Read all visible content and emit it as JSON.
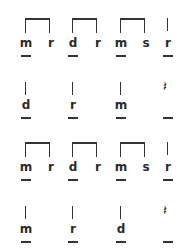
{
  "rows": [
    {
      "type": "beamed",
      "groups": [
        {
          "notes": [
            "m",
            "r"
          ],
          "underline": [
            true,
            false
          ]
        },
        {
          "notes": [
            "d",
            "r"
          ],
          "underline": [
            true,
            false
          ]
        },
        {
          "notes": [
            "m",
            "s"
          ],
          "underline": [
            true,
            false
          ]
        }
      ],
      "last": {
        "note": "r",
        "underline": true
      }
    },
    {
      "type": "quarters",
      "notes": [
        "d",
        "r",
        "m"
      ],
      "rest_icon": "quarter-rest"
    },
    {
      "type": "beamed",
      "groups": [
        {
          "notes": [
            "m",
            "r"
          ],
          "underline": [
            true,
            false
          ]
        },
        {
          "notes": [
            "d",
            "r"
          ],
          "underline": [
            true,
            false
          ]
        },
        {
          "notes": [
            "m",
            "s"
          ],
          "underline": [
            true,
            false
          ]
        }
      ],
      "last": {
        "note": "r",
        "underline": true
      }
    },
    {
      "type": "quarters",
      "notes": [
        "m",
        "r",
        "d"
      ],
      "rest_icon": "quarter-rest"
    }
  ],
  "rest_glyph": "𝄽"
}
